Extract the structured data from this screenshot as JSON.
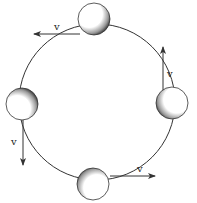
{
  "diagram": {
    "path_circle": {
      "cx": 97,
      "cy": 102,
      "r": 77
    },
    "balls": [
      {
        "name": "ball-top",
        "cx": 94,
        "cy": 19,
        "r": 16
      },
      {
        "name": "ball-right",
        "cx": 172,
        "cy": 102,
        "r": 16
      },
      {
        "name": "ball-left",
        "cx": 22,
        "cy": 104,
        "r": 16
      },
      {
        "name": "ball-bottom",
        "cx": 93,
        "cy": 184,
        "r": 16
      }
    ],
    "vectors": [
      {
        "name": "velocity-top",
        "label": "v",
        "direction": "left"
      },
      {
        "name": "velocity-right",
        "label": "v",
        "direction": "up"
      },
      {
        "name": "velocity-left",
        "label": "v",
        "direction": "down"
      },
      {
        "name": "velocity-bottom",
        "label": "v",
        "direction": "right"
      }
    ],
    "colors": {
      "line": "#333333",
      "ball_fill": "#ffffff",
      "shade": "#222222"
    }
  }
}
